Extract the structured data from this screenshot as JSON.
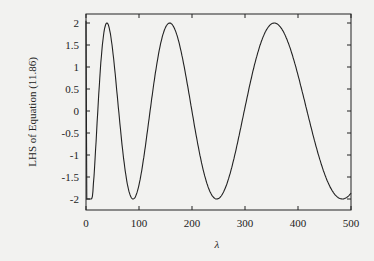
{
  "chart_data": {
    "type": "line",
    "title": "",
    "xlabel": "λ",
    "ylabel": "LHS of Equation (11.86)",
    "xlim": [
      0,
      500
    ],
    "ylim": [
      -2.2,
      2.2
    ],
    "xticks": [
      "0",
      "100",
      "200",
      "300",
      "400",
      "500"
    ],
    "yticks": [
      "2",
      "1.5",
      "1",
      "0.5",
      "0",
      "-0.5",
      "-1",
      "-1.5",
      "-2"
    ],
    "grid": false,
    "legend": null,
    "series": [
      {
        "name": "LHS",
        "description": "approximately 2cos(sqrt(lambda)), clipped at -2 near lambda 2-10",
        "x": [
          0,
          2,
          8,
          15,
          25,
          40,
          60,
          88,
          120,
          155,
          200,
          247,
          300,
          353,
          420,
          481,
          500
        ],
        "values": [
          2.0,
          -2.0,
          -2.0,
          -1.4,
          0.0,
          2.0,
          0.0,
          -2.0,
          0.0,
          2.0,
          0.0,
          -2.0,
          0.0,
          2.0,
          0.0,
          -2.0,
          -1.9
        ]
      }
    ],
    "peaks_lambda": [
      40,
      155,
      353
    ],
    "troughs_lambda": [
      88,
      247,
      481
    ]
  }
}
